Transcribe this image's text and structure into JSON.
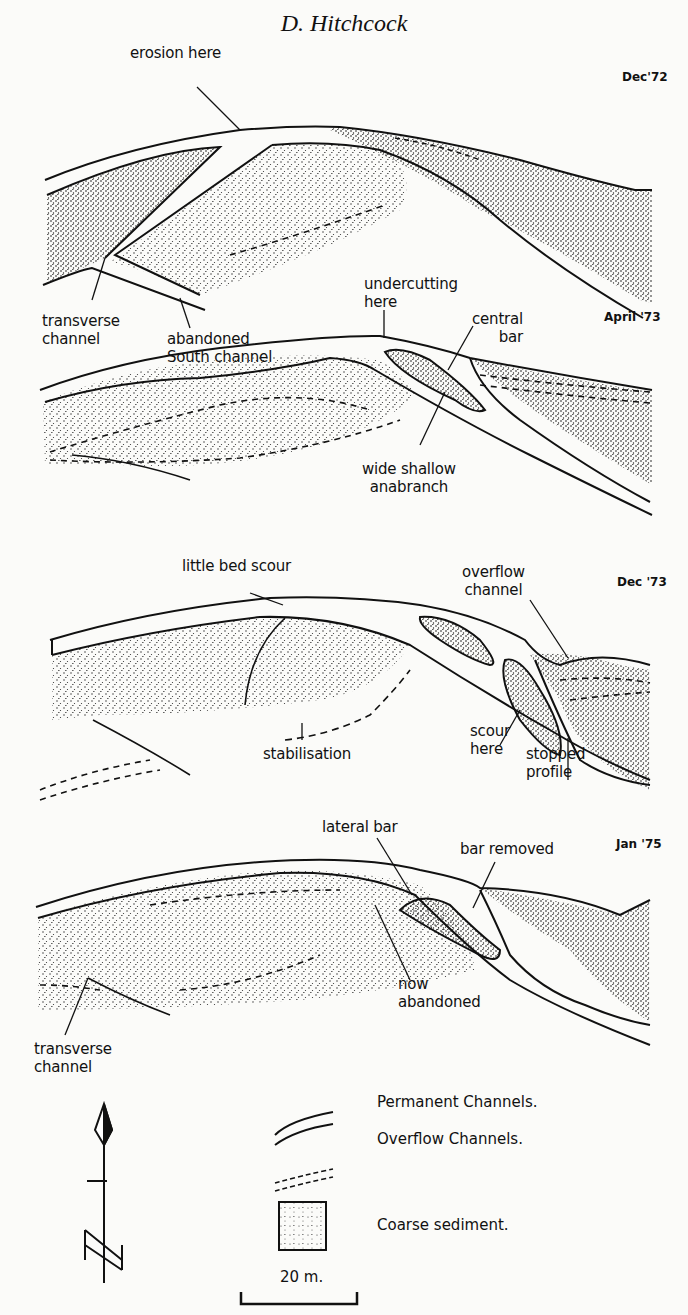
{
  "header": {
    "author": "D. Hitchcock"
  },
  "panels": [
    {
      "date": "Dec'72",
      "labels": {
        "erosion": "erosion here",
        "transverse": "transverse\nchannel",
        "abandoned": "abandoned\nSouth channel"
      }
    },
    {
      "date": "April '73",
      "labels": {
        "undercutting": "undercutting\nhere",
        "central_bar": "central\nbar",
        "anabranch": "wide shallow\nanabranch"
      }
    },
    {
      "date": "Dec '73",
      "labels": {
        "little_bed_scour": "little bed scour",
        "overflow_channel": "overflow\nchannel",
        "stabilisation": "stabilisation",
        "scour_here": "scour\nhere",
        "stopped_profile": "stopped\nprofile"
      }
    },
    {
      "date": "Jan '75",
      "labels": {
        "lateral_bar": "lateral bar",
        "bar_removed": "bar removed",
        "now_abandoned": "now\nabandoned",
        "transverse": "transverse\nchannel"
      }
    }
  ],
  "legend": {
    "items": [
      {
        "symbol": "double-solid-line",
        "label": "Permanent Channels."
      },
      {
        "symbol": "double-dashed-line",
        "label": "Overflow Channels."
      },
      {
        "symbol": "stippled-square",
        "label": "Coarse sediment."
      }
    ],
    "scale_bar": "20 m.",
    "north_arrow": "north-arrow-icon"
  }
}
